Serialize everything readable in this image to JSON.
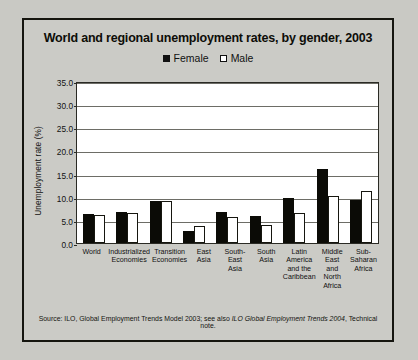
{
  "figure": {
    "title": "World and regional unemployment rates, by gender, 2003",
    "source": "Source: ILO, Global Employment Trends Model 2003; see also ",
    "source_italic": "ILO Global Employment Trends 2004",
    "source_tail": ", Technical note."
  },
  "legend": {
    "female_label": "Female",
    "male_label": "Male"
  },
  "axis": {
    "ylabel": "Unemployment rate (%)",
    "ticks": [
      "35.0",
      "30.0",
      "25.0",
      "20.0",
      "15.0",
      "10.0",
      "5.0",
      "0.0"
    ]
  },
  "colors": {
    "female": "#0b0b06",
    "male": "#ffffff",
    "frame": "#15150f",
    "page": "#c9c9c4",
    "plot_bg": "#ffffff",
    "grid": "#6d6d66"
  },
  "chart_data": {
    "type": "bar",
    "title": "World and regional unemployment rates, by gender, 2003",
    "xlabel": "",
    "ylabel": "Unemployment rate (%)",
    "ylim": [
      0,
      35
    ],
    "ytick_step": 5,
    "grid": true,
    "legend_position": "top-center",
    "categories": [
      "World",
      "Industrialized Economies",
      "Transition Economies",
      "East Asia",
      "South-East Asia",
      "South Asia",
      "Latin America and the Caribbean",
      "Middle East and North Africa",
      "Sub-Saharan Africa"
    ],
    "category_lines": [
      [
        "World"
      ],
      [
        "Industrialized",
        "Economies"
      ],
      [
        "Transition",
        "Economies"
      ],
      [
        "East Asia"
      ],
      [
        "South-East",
        "Asia"
      ],
      [
        "South",
        "Asia"
      ],
      [
        "Latin America",
        "and the",
        "Caribbean"
      ],
      [
        "Middle East",
        "and",
        "North Africa"
      ],
      [
        "Sub-Saharan",
        "Africa"
      ]
    ],
    "series": [
      {
        "name": "Female",
        "values": [
          6.3,
          6.8,
          9.1,
          2.5,
          6.6,
          5.8,
          9.8,
          16.0,
          9.2
        ]
      },
      {
        "name": "Male",
        "values": [
          6.0,
          6.5,
          9.0,
          3.6,
          5.6,
          3.9,
          6.4,
          10.2,
          11.3
        ]
      }
    ]
  }
}
